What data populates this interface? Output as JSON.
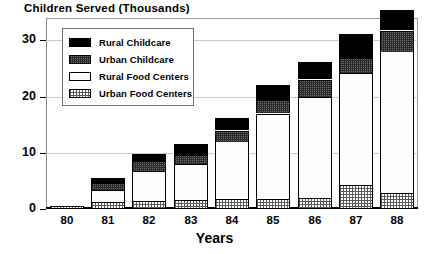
{
  "chart_data": {
    "type": "bar",
    "subtype": "stacked",
    "title": "Children Served (Thousands)",
    "xlabel": "Years",
    "ylabel": "",
    "ylim": [
      0,
      34
    ],
    "yticks": [
      0,
      10,
      20,
      30
    ],
    "ytick_labels": [
      "0",
      "10",
      "20",
      "30"
    ],
    "grid": true,
    "grid_axis": "y",
    "legend_position": "upper-left-inside",
    "categories": [
      "80",
      "81",
      "82",
      "83",
      "84",
      "85",
      "86",
      "87",
      "88"
    ],
    "series": [
      {
        "name": "Urban Food Centers",
        "pattern": "light-hatch",
        "color": "#ffffff",
        "values": [
          0.5,
          1.2,
          1.4,
          1.6,
          1.7,
          1.8,
          2.0,
          4.2,
          2.8
        ]
      },
      {
        "name": "Rural Food Centers",
        "pattern": "white",
        "color": "#fdfdfd",
        "values": [
          0.0,
          2.2,
          5.4,
          6.4,
          10.3,
          15.2,
          18.0,
          20.0,
          25.2
        ]
      },
      {
        "name": "Urban Childcare",
        "pattern": "dark-dither",
        "color": "#6d6d6d",
        "values": [
          0.0,
          1.3,
          1.7,
          1.6,
          2.0,
          2.4,
          3.1,
          2.6,
          3.8
        ]
      },
      {
        "name": "Rural Childcare",
        "pattern": "solid-black",
        "color": "#000000",
        "values": [
          0.0,
          0.9,
          1.3,
          2.0,
          2.2,
          2.6,
          3.1,
          4.3,
          3.6
        ]
      }
    ],
    "totals": [
      0.5,
      5.6,
      9.8,
      11.6,
      16.2,
      22.0,
      26.2,
      31.1,
      35.4
    ]
  },
  "legend": {
    "items": [
      {
        "label": "Rural Childcare",
        "swatch": "solid-black"
      },
      {
        "label": "Urban Childcare",
        "swatch": "dark-dither"
      },
      {
        "label": "Rural Food Centers",
        "swatch": "white"
      },
      {
        "label": "Urban Food Centers",
        "swatch": "light-hatch"
      }
    ]
  }
}
